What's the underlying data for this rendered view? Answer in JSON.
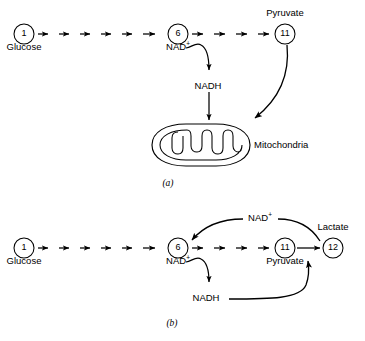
{
  "figure": {
    "stroke_color": "#000000",
    "background_color": "#ffffff"
  },
  "panels": [
    {
      "id": "a",
      "label": "(a)",
      "caption_x": 168,
      "caption_y": 180,
      "description": "Aerobic: pyruvate and NADH enter the mitochondria",
      "nodes": [
        {
          "name": "node-1",
          "number": "1",
          "label": "Glucose",
          "cx": 24,
          "cy": 34,
          "r": 10,
          "label_x": 24,
          "label_y": 47
        },
        {
          "name": "node-6",
          "number": "6",
          "label": "NAD+",
          "cx": 178,
          "cy": 34,
          "r": 10,
          "label_x": 178,
          "label_y": 47
        },
        {
          "name": "node-11",
          "number": "11",
          "label": "Pyruvate",
          "cx": 285,
          "cy": 34,
          "r": 10,
          "label_x": 285,
          "label_y": 10
        }
      ],
      "arrow_chains": [
        {
          "name": "chain-glucose-to-six",
          "from_x": 38,
          "to_x": 164,
          "y": 34,
          "count": 6
        },
        {
          "name": "chain-six-to-pyruvate",
          "from_x": 192,
          "to_x": 271,
          "y": 34,
          "count": 4
        }
      ],
      "cofactors": [
        {
          "name": "nadh-label",
          "text": "NADH",
          "x": 208,
          "y": 86
        }
      ],
      "organelle": {
        "name": "mitochondrion",
        "label": "Mitochondria",
        "label_x": 255,
        "label_y": 140
      }
    },
    {
      "id": "b",
      "label": "(b)",
      "caption_x": 172,
      "caption_y": 320,
      "description": "Anaerobic: NADH reduces pyruvate to lactate, regenerating NAD+",
      "nodes": [
        {
          "name": "node-1",
          "number": "1",
          "label": "Glucose",
          "cx": 24,
          "cy": 248,
          "r": 10,
          "label_x": 24,
          "label_y": 261
        },
        {
          "name": "node-6",
          "number": "6",
          "label": "NAD+",
          "cx": 178,
          "cy": 248,
          "r": 10,
          "label_x": 178,
          "label_y": 261
        },
        {
          "name": "node-11",
          "number": "11",
          "label": "Pyruvate",
          "cx": 285,
          "cy": 248,
          "r": 10,
          "label_x": 285,
          "label_y": 261
        },
        {
          "name": "node-12",
          "number": "12",
          "label": "Lactate",
          "cx": 333,
          "cy": 248,
          "r": 10,
          "label_x": 333,
          "label_y": 225
        }
      ],
      "arrow_chains": [
        {
          "name": "chain-glucose-to-six",
          "from_x": 38,
          "to_x": 164,
          "y": 248,
          "count": 6
        },
        {
          "name": "chain-six-to-pyruvate",
          "from_x": 192,
          "to_x": 271,
          "y": 248,
          "count": 4
        }
      ],
      "cofactors": [
        {
          "name": "nad-plus-return-label",
          "text": "NAD+",
          "x": 258,
          "y": 224
        },
        {
          "name": "nadh-label",
          "text": "NADH",
          "x": 208,
          "y": 297
        }
      ]
    }
  ]
}
